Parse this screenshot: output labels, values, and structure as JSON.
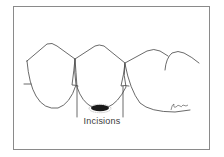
{
  "figure": {
    "type": "dental-illustration",
    "label": "Incisions",
    "signature": "artist-signature",
    "colors": {
      "line": "#444444",
      "frame": "#8a8a8a",
      "incision_mark": "#1a1a1a",
      "background": "#ffffff"
    }
  }
}
